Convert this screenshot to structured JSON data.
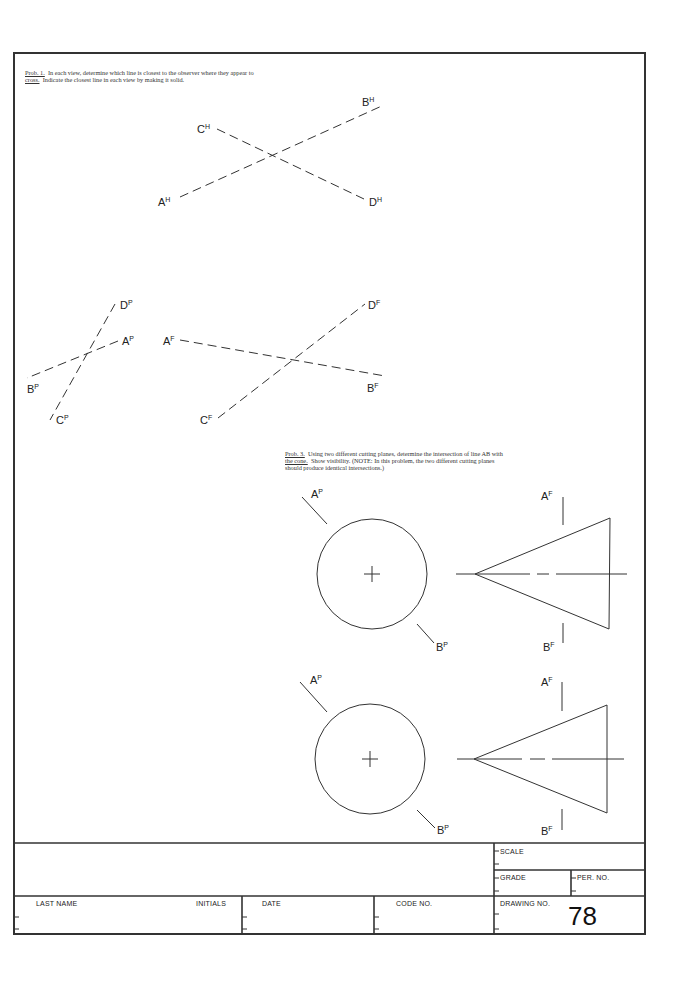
{
  "prob1": {
    "label": "Prob. 1.",
    "line1": "In each view, determine which line is closest to the observer where they appear to",
    "line2_label": "cross.",
    "line2": "Indicate the closest line in each view by making it solid.",
    "views": {
      "horizontal": {
        "A": "A",
        "B": "B",
        "C": "C",
        "D": "D",
        "sup": "H"
      },
      "profile": {
        "A": "A",
        "B": "B",
        "C": "C",
        "D": "D",
        "sup": "P"
      },
      "frontal": {
        "A": "A",
        "B": "B",
        "C": "C",
        "D": "D",
        "sup": "F"
      }
    }
  },
  "prob3": {
    "label": "Prob. 3.",
    "line1": "Using two different cutting planes, determine the intersection of line AB with",
    "line2_label": "the cone.",
    "line2": "Show visibility.  (NOTE: In this problem, the two different cutting planes",
    "line3": "should produce identical intersections.)",
    "views": {
      "top_pair": {
        "A_p": "A",
        "B_p": "B",
        "A_f": "A",
        "B_f": "B",
        "sup_p": "P",
        "sup_f": "F"
      },
      "bottom_pair": {
        "A_p": "A",
        "B_p": "B",
        "A_f": "A",
        "B_f": "B",
        "sup_p": "P",
        "sup_f": "F"
      }
    }
  },
  "title_block": {
    "scale_label": "SCALE",
    "grade_label": "GRADE",
    "per_no_label": "PER.  NO.",
    "last_name_label": "LAST  NAME",
    "initials_label": "INITIALS",
    "date_label": "DATE",
    "code_no_label": "CODE   NO.",
    "drawing_no_label": "DRAWING   NO.",
    "drawing_no_value": "78"
  }
}
